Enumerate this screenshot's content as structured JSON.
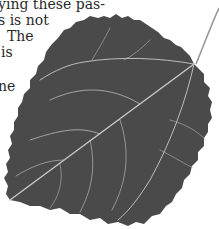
{
  "text_lines": [
    {
      "text": "ying these pas-",
      "x": -2,
      "y": -4
    },
    {
      "text": "s is not",
      "x": -2,
      "y": 12
    },
    {
      "text": "The",
      "x": 7,
      "y": 28
    },
    {
      "text": "is",
      "x": 1,
      "y": 44
    },
    {
      "text": "ne",
      "x": -2,
      "y": 78
    }
  ],
  "illustration": {
    "subject": "leaf",
    "leaf_color": "#4a4a4a",
    "vein_color": "#c8c8c8",
    "stem_color": "#9a9a9a"
  }
}
